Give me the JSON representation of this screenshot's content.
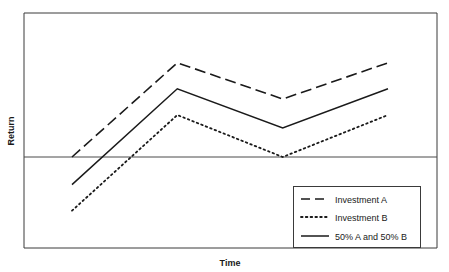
{
  "chart_data": {
    "type": "line",
    "title": "",
    "xlabel": "Time",
    "ylabel": "Return",
    "grid": false,
    "legend_position": "bottom-right",
    "zero_line": 0,
    "x": [
      0,
      1,
      2,
      3
    ],
    "xlim": [
      0,
      3
    ],
    "ylim": [
      -2.2,
      4.0
    ],
    "x_tick_labels": [],
    "y_tick_labels": [],
    "series": [
      {
        "name": "Investment A",
        "style": "dashed",
        "color": "#1a1a1a",
        "values": [
          0.0,
          3.25,
          2.0,
          3.25
        ]
      },
      {
        "name": "Investment B",
        "style": "dotted",
        "color": "#1a1a1a",
        "values": [
          -1.85,
          1.45,
          0.0,
          1.45
        ]
      },
      {
        "name": "50% A and 50% B",
        "style": "solid",
        "color": "#1a1a1a",
        "values": [
          -0.95,
          2.35,
          1.0,
          2.35
        ]
      }
    ]
  },
  "axes": {
    "y_label": "Return",
    "x_label": "Time"
  },
  "legend": {
    "items": [
      {
        "label": "Investment A",
        "style": "dashed"
      },
      {
        "label": "Investment B",
        "style": "dotted"
      },
      {
        "label": "50% A and 50% B",
        "style": "solid"
      }
    ]
  },
  "colors": {
    "ink": "#1a1a1a",
    "frame": "#3a3a3a",
    "background": "#ffffff"
  }
}
